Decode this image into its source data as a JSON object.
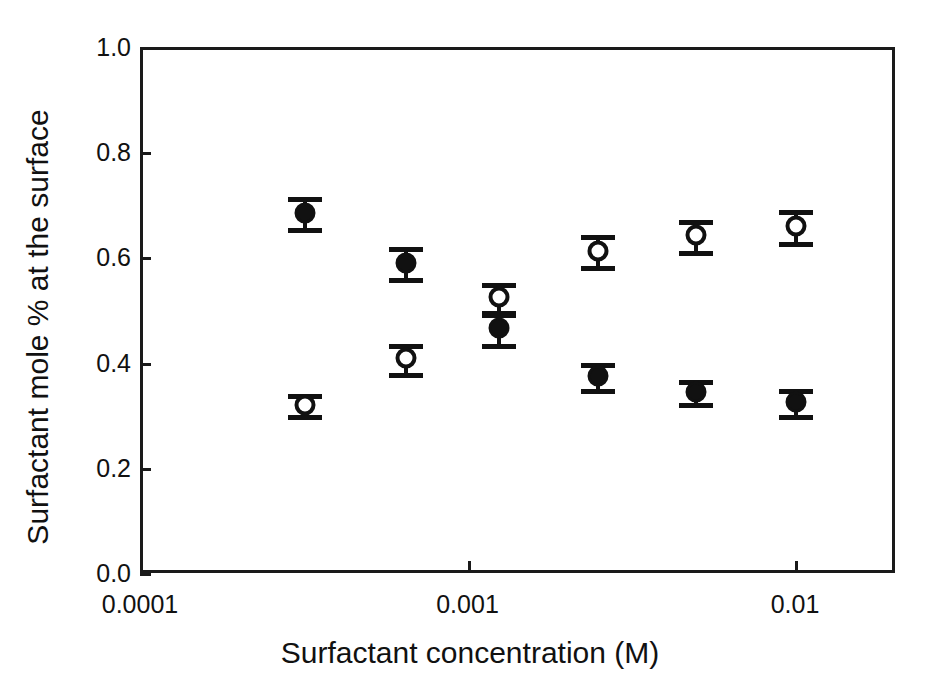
{
  "chart_data": {
    "type": "scatter",
    "title": "",
    "xlabel": "Surfactant concentration (M)",
    "ylabel": "Surfactant mole % at the surface",
    "xscale": "log",
    "yscale": "linear",
    "xlim": [
      0.0001,
      0.02
    ],
    "ylim": [
      0.0,
      1.0
    ],
    "grid": false,
    "legend": "none",
    "xticks": [
      {
        "value": 0.0001,
        "label": "0.0001"
      },
      {
        "value": 0.001,
        "label": "0.001"
      },
      {
        "value": 0.01,
        "label": "0.01"
      }
    ],
    "yticks": [
      {
        "value": 0.0,
        "label": "0.0"
      },
      {
        "value": 0.2,
        "label": "0.2"
      },
      {
        "value": 0.4,
        "label": "0.4"
      },
      {
        "value": 0.6,
        "label": "0.6"
      },
      {
        "value": 0.8,
        "label": "0.8"
      },
      {
        "value": 1.0,
        "label": "1.0"
      }
    ],
    "series": [
      {
        "name": "filled-circles",
        "marker": "filled-circle",
        "color": "#111111",
        "points": [
          {
            "x": 0.00032,
            "y": 0.685,
            "yerr": 0.03
          },
          {
            "x": 0.00065,
            "y": 0.59,
            "yerr": 0.03
          },
          {
            "x": 0.00125,
            "y": 0.465,
            "yerr": 0.03
          },
          {
            "x": 0.0025,
            "y": 0.375,
            "yerr": 0.025
          },
          {
            "x": 0.005,
            "y": 0.345,
            "yerr": 0.022
          },
          {
            "x": 0.0101,
            "y": 0.325,
            "yerr": 0.025
          }
        ]
      },
      {
        "name": "open-circles",
        "marker": "open-circle",
        "color": "#111111",
        "points": [
          {
            "x": 0.00032,
            "y": 0.32,
            "yerr": 0.02
          },
          {
            "x": 0.00065,
            "y": 0.408,
            "yerr": 0.027
          },
          {
            "x": 0.00125,
            "y": 0.525,
            "yerr": 0.027
          },
          {
            "x": 0.0025,
            "y": 0.613,
            "yerr": 0.03
          },
          {
            "x": 0.005,
            "y": 0.642,
            "yerr": 0.03
          },
          {
            "x": 0.0101,
            "y": 0.66,
            "yerr": 0.03
          }
        ]
      }
    ]
  }
}
